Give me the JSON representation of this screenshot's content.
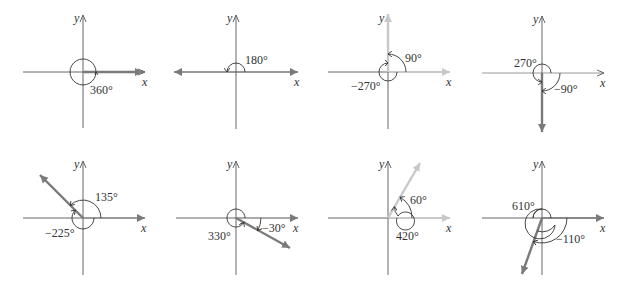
{
  "figure": {
    "axis_labels": {
      "x": "x",
      "y": "y"
    },
    "colors": {
      "axis": "#555555",
      "terminal_dark": "#7a7a7a",
      "terminal_light": "#c8c8c8",
      "arc": "#333333",
      "text": "#333333"
    },
    "panels": [
      {
        "id": "p1",
        "angles": [
          "360°"
        ],
        "terminal_deg": 0
      },
      {
        "id": "p2",
        "angles": [
          "180°"
        ],
        "terminal_deg": 180
      },
      {
        "id": "p3",
        "angles": [
          "90°",
          "−270°"
        ],
        "terminal_deg": 90
      },
      {
        "id": "p4",
        "angles": [
          "270°",
          "−90°"
        ],
        "terminal_deg": 270
      },
      {
        "id": "p5",
        "angles": [
          "135°",
          "−225°"
        ],
        "terminal_deg": 135
      },
      {
        "id": "p6",
        "angles": [
          "330°",
          "−30°"
        ],
        "terminal_deg": 330
      },
      {
        "id": "p7",
        "angles": [
          "60°",
          "420°"
        ],
        "terminal_deg": 60
      },
      {
        "id": "p8",
        "angles": [
          "610°",
          "−110°"
        ],
        "terminal_deg": 250
      }
    ]
  }
}
